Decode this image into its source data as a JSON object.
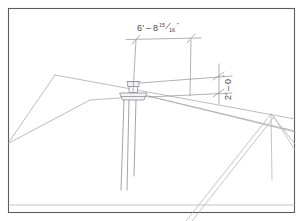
{
  "drawing": {
    "title": "Roof Vent Pipe Location Detail",
    "sheet_background": "#ffffff",
    "border_color": "#5a5a5a",
    "line_color": "#b9b9bd",
    "object_line_color": "#9a9aa0",
    "dimension_line_color": "#8f8f95",
    "text_color": "#4a4a4a"
  },
  "dimensions": {
    "horizontal": {
      "label": "6'-8 15⁄ 16\"",
      "feet": "6'",
      "dash": "–",
      "inches_whole": "8",
      "fraction_numerator": "15",
      "fraction_denominator": "16",
      "inch_mark": "\"",
      "name": "horizontal-offset-dimension"
    },
    "vertical": {
      "label": "2'-0\"",
      "feet": "2'",
      "dash": "–",
      "inches_whole": "0",
      "inch_mark": "\"",
      "name": "vertical-height-dimension"
    }
  },
  "geometry": {
    "border": {
      "x": 8,
      "y": 8,
      "w": 287,
      "h": 205
    },
    "roof": {
      "left_eave": "9,141",
      "left_hip_apex": "55,75",
      "ridge_right": "145,88",
      "far_right": "295,119",
      "description": "main-roof-planes"
    },
    "vent_pipe": {
      "cap_x": 132,
      "cap_y": 84,
      "flange_y": 95,
      "base_y": 190,
      "label": "vent-pipe-stack"
    }
  }
}
